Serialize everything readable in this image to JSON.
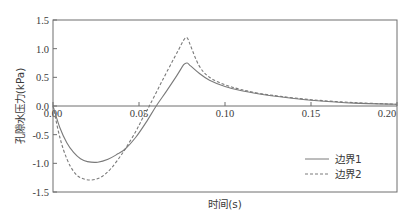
{
  "chart_data": {
    "type": "line",
    "title": "",
    "xlabel": "时间(s)",
    "ylabel": "孔隙水压力(kPa)",
    "xlim": [
      0,
      0.2
    ],
    "ylim": [
      -1.5,
      1.5
    ],
    "xticks": [
      0.0,
      0.05,
      0.1,
      0.15,
      0.2
    ],
    "xtick_labels": [
      "0.00",
      "0.05",
      "0.10",
      "0.15",
      "0.20"
    ],
    "yticks": [
      1.5,
      1.0,
      0.5,
      0.0,
      -0.5,
      -1.0,
      -1.5
    ],
    "ytick_labels": [
      "1.5",
      "1.0",
      "0.5",
      "0.0",
      "-0.5",
      "-1.0",
      "-1.5"
    ],
    "grid": false,
    "zero_line": true,
    "legend_position": "lower right",
    "series": [
      {
        "name": "边界1",
        "style": "solid",
        "x": [
          0.0,
          0.004,
          0.008,
          0.012,
          0.016,
          0.02,
          0.026,
          0.032,
          0.038,
          0.042,
          0.048,
          0.054,
          0.06,
          0.066,
          0.072,
          0.076,
          0.078,
          0.08,
          0.085,
          0.091,
          0.1,
          0.109,
          0.12,
          0.132,
          0.15,
          0.175,
          0.2
        ],
        "y": [
          0.0,
          -0.38,
          -0.64,
          -0.81,
          -0.92,
          -0.97,
          -0.98,
          -0.93,
          -0.83,
          -0.75,
          -0.55,
          -0.29,
          0.0,
          0.26,
          0.53,
          0.72,
          0.75,
          0.7,
          0.57,
          0.45,
          0.34,
          0.27,
          0.21,
          0.16,
          0.1,
          0.05,
          0.03
        ]
      },
      {
        "name": "边界2",
        "style": "dashed",
        "x": [
          0.0,
          0.004,
          0.008,
          0.012,
          0.016,
          0.022,
          0.028,
          0.034,
          0.04,
          0.042,
          0.048,
          0.052,
          0.056,
          0.062,
          0.068,
          0.073,
          0.076,
          0.078,
          0.08,
          0.085,
          0.091,
          0.1,
          0.109,
          0.12,
          0.132,
          0.15,
          0.175,
          0.2
        ],
        "y": [
          0.0,
          -0.55,
          -0.92,
          -1.14,
          -1.25,
          -1.29,
          -1.24,
          -1.08,
          -0.84,
          -0.75,
          -0.45,
          -0.22,
          0.0,
          0.35,
          0.7,
          0.98,
          1.15,
          1.19,
          1.05,
          0.7,
          0.5,
          0.37,
          0.29,
          0.22,
          0.17,
          0.11,
          0.06,
          0.03
        ]
      }
    ]
  },
  "legend": {
    "items": [
      {
        "label": "边界1",
        "style": "solid"
      },
      {
        "label": "边界2",
        "style": "dashed"
      }
    ]
  },
  "colors": {
    "axis": "#6e6e6e",
    "series1": "#7a7a7a",
    "series2": "#7a7a7a",
    "text": "#3a3a3a"
  }
}
